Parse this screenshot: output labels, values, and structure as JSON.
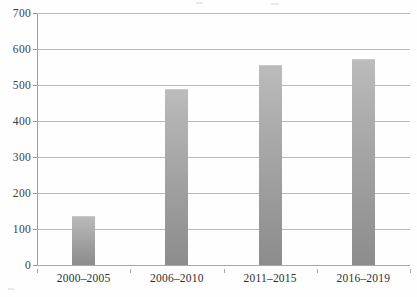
{
  "chart_data": {
    "type": "bar",
    "title": "",
    "subtitle": "",
    "xlabel": "",
    "ylabel": "",
    "categories": [
      "2000–2005",
      "2006–2010",
      "2011–2015",
      "2016–2019"
    ],
    "values": [
      137,
      488,
      556,
      573
    ],
    "series": [
      {
        "name": "",
        "values": [
          137,
          488,
          556,
          573
        ]
      }
    ],
    "ylim": [
      0,
      700
    ],
    "ytick_labels": [
      "700",
      "600",
      "500",
      "400",
      "300",
      "200",
      "100",
      "0"
    ],
    "ytick_values": [
      700,
      600,
      500,
      400,
      300,
      200,
      100,
      0
    ],
    "ytick_step": 100,
    "grid": true,
    "grid_axis": "y",
    "legend": false,
    "legend_position": "none",
    "annotations": [],
    "data_labels": false,
    "bar_color_top": "#bcbcbc",
    "bar_color_bottom": "#8c8c8c",
    "gridline_color": "#b9b9b9",
    "axis_color": "#a0a0a0",
    "text_color": "#2e2e2e",
    "background_color": "#fefefe"
  },
  "figure": {
    "name": "bar-chart"
  }
}
